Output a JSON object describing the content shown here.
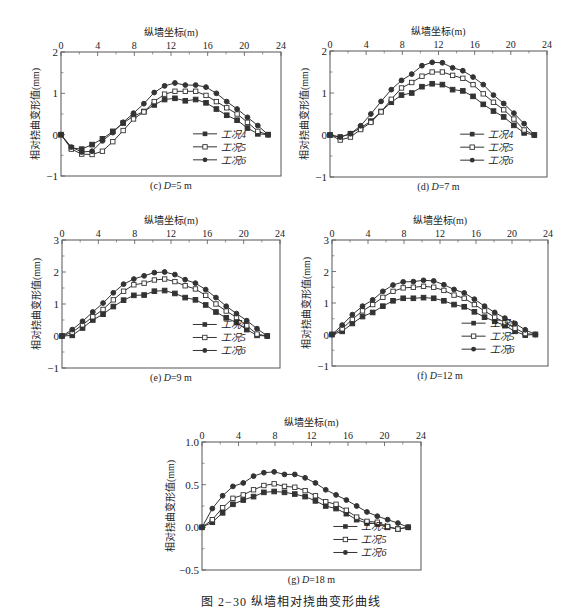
{
  "figure": {
    "caption": "图 2−30   纵墙相对挠曲变形曲线"
  },
  "common": {
    "xlabel": "纵墙坐标(m)",
    "ylabel": "相对挠曲变形值(mm)",
    "x": [
      0,
      1.13,
      2.26,
      3.39,
      4.52,
      5.65,
      6.78,
      7.91,
      9.04,
      10.17,
      11.3,
      12.43,
      13.56,
      14.69,
      15.82,
      16.95,
      18.08,
      19.21,
      20.34,
      21.47,
      22.6
    ],
    "xticks": [
      0,
      4,
      8,
      12,
      16,
      20,
      24
    ],
    "legend": [
      "工况4",
      "工况5",
      "工况6"
    ]
  },
  "chart_data": [
    {
      "id": "c",
      "type": "line",
      "title": "(c) D=5 m",
      "title_prefix": "(c) ",
      "title_var": "D",
      "title_suffix": "=5 m",
      "xlabel": "纵墙坐标(m)",
      "ylabel": "相对挠曲变形值(mm)",
      "xlim": [
        0,
        24
      ],
      "ylim": [
        -1,
        2
      ],
      "yticks": [
        "2",
        "1",
        "0",
        "−1"
      ],
      "ytick_values": [
        2,
        1,
        0,
        -1
      ],
      "x": [
        0,
        1.13,
        2.26,
        3.39,
        4.52,
        5.65,
        6.78,
        7.91,
        9.04,
        10.17,
        11.3,
        12.43,
        13.56,
        14.69,
        15.82,
        16.95,
        18.08,
        19.21,
        20.34,
        21.47,
        22.6
      ],
      "series": [
        {
          "name": "工况4",
          "marker": "square-filled",
          "values": [
            0,
            -0.32,
            -0.35,
            -0.24,
            -0.1,
            0.08,
            0.28,
            0.45,
            0.56,
            0.72,
            0.85,
            0.88,
            0.82,
            0.85,
            0.77,
            0.62,
            0.47,
            0.35,
            0.16,
            0.02,
            0
          ]
        },
        {
          "name": "工况5",
          "marker": "square-open",
          "values": [
            0,
            -0.35,
            -0.47,
            -0.48,
            -0.4,
            -0.17,
            0.1,
            0.38,
            0.55,
            0.8,
            0.98,
            1.05,
            1.05,
            1.05,
            0.95,
            0.8,
            0.65,
            0.5,
            0.3,
            0.08,
            0
          ]
        },
        {
          "name": "工况6",
          "marker": "circle-filled",
          "values": [
            0,
            -0.3,
            -0.42,
            -0.4,
            -0.15,
            0.05,
            0.3,
            0.52,
            0.75,
            1.02,
            1.18,
            1.25,
            1.2,
            1.2,
            1.15,
            1.0,
            0.8,
            0.62,
            0.42,
            0.22,
            0
          ]
        }
      ],
      "legend_position": "lower right",
      "grid": false
    },
    {
      "id": "d",
      "type": "line",
      "title": "(d) D=7 m",
      "title_prefix": "(d) ",
      "title_var": "D",
      "title_suffix": "=7 m",
      "xlabel": "纵墙坐标(m)",
      "ylabel": "相对挠曲变形值(mm)",
      "xlim": [
        0,
        24
      ],
      "ylim": [
        -1,
        2
      ],
      "yticks": [
        "2",
        "1",
        "0",
        "−1"
      ],
      "ytick_values": [
        2,
        1,
        0,
        -1
      ],
      "x": [
        0,
        1.13,
        2.26,
        3.39,
        4.52,
        5.65,
        6.78,
        7.91,
        9.04,
        10.17,
        11.3,
        12.43,
        13.56,
        14.69,
        15.82,
        16.95,
        18.08,
        19.21,
        20.34,
        21.47,
        22.6
      ],
      "series": [
        {
          "name": "工况4",
          "marker": "square-filled",
          "values": [
            0,
            -0.05,
            0.03,
            0.17,
            0.33,
            0.56,
            0.78,
            0.95,
            1.0,
            1.15,
            1.22,
            1.2,
            1.08,
            1.05,
            0.92,
            0.73,
            0.57,
            0.43,
            0.23,
            0.05,
            0
          ]
        },
        {
          "name": "工况5",
          "marker": "square-open",
          "values": [
            0,
            -0.12,
            -0.05,
            0.13,
            0.3,
            0.55,
            0.85,
            1.12,
            1.25,
            1.4,
            1.5,
            1.5,
            1.42,
            1.35,
            1.2,
            0.98,
            0.78,
            0.6,
            0.38,
            0.12,
            0
          ]
        },
        {
          "name": "工况6",
          "marker": "circle-filled",
          "values": [
            0,
            -0.05,
            0.03,
            0.22,
            0.5,
            0.8,
            1.08,
            1.3,
            1.45,
            1.65,
            1.73,
            1.72,
            1.6,
            1.53,
            1.38,
            1.2,
            0.95,
            0.75,
            0.52,
            0.27,
            0
          ]
        }
      ],
      "legend_position": "lower right",
      "grid": false
    },
    {
      "id": "e",
      "type": "line",
      "title": "(e) D=9 m",
      "title_prefix": "(e) ",
      "title_var": "D",
      "title_suffix": "=9 m",
      "xlabel": "纵墙坐标(m)",
      "ylabel": "相对挠曲变形值(mm)",
      "xlim": [
        0,
        24
      ],
      "ylim": [
        -1,
        3
      ],
      "yticks": [
        "3",
        "2",
        "1",
        "0",
        "−1"
      ],
      "ytick_values": [
        3,
        2,
        1,
        0,
        -1
      ],
      "x": [
        0,
        1.13,
        2.26,
        3.39,
        4.52,
        5.65,
        6.78,
        7.91,
        9.04,
        10.17,
        11.3,
        12.43,
        13.56,
        14.69,
        15.82,
        16.95,
        18.08,
        19.21,
        20.34,
        21.47,
        22.6
      ],
      "series": [
        {
          "name": "工况4",
          "marker": "square-filled",
          "values": [
            0,
            0.02,
            0.25,
            0.5,
            0.68,
            0.92,
            1.12,
            1.27,
            1.28,
            1.4,
            1.42,
            1.33,
            1.2,
            1.13,
            0.97,
            0.75,
            0.57,
            0.42,
            0.2,
            0.02,
            0
          ]
        },
        {
          "name": "工况5",
          "marker": "square-open",
          "values": [
            0,
            0.12,
            0.35,
            0.6,
            0.83,
            1.13,
            1.4,
            1.6,
            1.65,
            1.75,
            1.78,
            1.7,
            1.57,
            1.47,
            1.27,
            1.0,
            0.78,
            0.58,
            0.32,
            0.06,
            0
          ]
        },
        {
          "name": "工况6",
          "marker": "circle-filled",
          "values": [
            0,
            0.2,
            0.46,
            0.75,
            1.03,
            1.35,
            1.62,
            1.78,
            1.88,
            1.98,
            2.0,
            1.92,
            1.76,
            1.65,
            1.45,
            1.2,
            0.93,
            0.7,
            0.48,
            0.23,
            0
          ]
        }
      ],
      "legend_position": "lower right",
      "grid": false
    },
    {
      "id": "f",
      "type": "line",
      "title": "(f) D=12 m",
      "title_prefix": "(f) ",
      "title_var": "D",
      "title_suffix": "=12 m",
      "xlabel": "纵墙坐标(m)",
      "ylabel": "相对挠曲变形值(mm)",
      "xlim": [
        0,
        24
      ],
      "ylim": [
        -1,
        3
      ],
      "yticks": [
        "3",
        "2",
        "1",
        "0",
        "−1"
      ],
      "ytick_values": [
        3,
        2,
        1,
        0,
        -1
      ],
      "x": [
        0,
        1.13,
        2.26,
        3.39,
        4.52,
        5.65,
        6.78,
        7.91,
        9.04,
        10.17,
        11.3,
        12.43,
        13.56,
        14.69,
        15.82,
        16.95,
        18.08,
        19.21,
        20.34,
        21.47,
        22.6
      ],
      "series": [
        {
          "name": "工况4",
          "marker": "square-filled",
          "values": [
            0,
            0.1,
            0.35,
            0.57,
            0.7,
            0.9,
            1.07,
            1.15,
            1.15,
            1.17,
            1.15,
            1.07,
            0.95,
            0.88,
            0.72,
            0.55,
            0.42,
            0.28,
            0.1,
            -0.02,
            0
          ]
        },
        {
          "name": "工况5",
          "marker": "square-open",
          "values": [
            0,
            0.18,
            0.48,
            0.75,
            0.95,
            1.18,
            1.37,
            1.48,
            1.5,
            1.53,
            1.5,
            1.4,
            1.25,
            1.15,
            0.95,
            0.75,
            0.55,
            0.38,
            0.2,
            0.03,
            0
          ]
        },
        {
          "name": "工况6",
          "marker": "circle-filled",
          "values": [
            0,
            0.3,
            0.63,
            0.9,
            1.1,
            1.37,
            1.57,
            1.67,
            1.68,
            1.72,
            1.7,
            1.58,
            1.43,
            1.32,
            1.12,
            0.9,
            0.7,
            0.52,
            0.35,
            0.15,
            0
          ]
        }
      ],
      "legend_position": "lower right",
      "grid": false
    },
    {
      "id": "g",
      "type": "line",
      "title": "(g) D=18 m",
      "title_prefix": "(g) ",
      "title_var": "D",
      "title_suffix": "=18 m",
      "xlabel": "纵墙坐标(m)",
      "ylabel": "相对挠曲变形值(mm)",
      "xlim": [
        0,
        24
      ],
      "ylim": [
        -0.5,
        1.0
      ],
      "yticks": [
        "1.0",
        "0.5",
        "0.0",
        "−0.5"
      ],
      "ytick_values": [
        1.0,
        0.5,
        0.0,
        -0.5
      ],
      "x": [
        0,
        1.13,
        2.26,
        3.39,
        4.52,
        5.65,
        6.78,
        7.91,
        9.04,
        10.17,
        11.3,
        12.43,
        13.56,
        14.69,
        15.82,
        16.95,
        18.08,
        19.21,
        20.34,
        21.47,
        22.6
      ],
      "series": [
        {
          "name": "工况4",
          "marker": "square-filled",
          "values": [
            0,
            0.06,
            0.17,
            0.27,
            0.32,
            0.36,
            0.41,
            0.42,
            0.41,
            0.39,
            0.36,
            0.31,
            0.25,
            0.22,
            0.16,
            0.09,
            0.05,
            0.04,
            0.0,
            -0.02,
            0
          ]
        },
        {
          "name": "工况5",
          "marker": "square-open",
          "values": [
            0,
            0.09,
            0.23,
            0.34,
            0.38,
            0.44,
            0.49,
            0.51,
            0.48,
            0.47,
            0.43,
            0.37,
            0.3,
            0.27,
            0.2,
            0.12,
            0.07,
            0.06,
            0.01,
            -0.02,
            0
          ]
        },
        {
          "name": "工况6",
          "marker": "circle-filled",
          "values": [
            0,
            0.22,
            0.37,
            0.48,
            0.52,
            0.6,
            0.64,
            0.65,
            0.62,
            0.62,
            0.58,
            0.52,
            0.44,
            0.38,
            0.32,
            0.25,
            0.18,
            0.13,
            0.09,
            0.05,
            0
          ]
        }
      ],
      "legend_position": "lower right",
      "grid": false
    }
  ],
  "layout": {
    "panels": [
      {
        "id": "c",
        "plot": {
          "left": 61,
          "top": 52,
          "width": 220,
          "height": 124
        }
      },
      {
        "id": "d",
        "plot": {
          "left": 330,
          "top": 51,
          "width": 217,
          "height": 126
        }
      },
      {
        "id": "e",
        "plot": {
          "left": 62,
          "top": 240,
          "width": 218,
          "height": 128
        }
      },
      {
        "id": "f",
        "plot": {
          "left": 332,
          "top": 240,
          "width": 216,
          "height": 126
        }
      },
      {
        "id": "g",
        "plot": {
          "left": 202,
          "top": 442,
          "width": 219,
          "height": 128
        }
      }
    ],
    "line_color": "#333333",
    "axis_color": "#555555"
  }
}
